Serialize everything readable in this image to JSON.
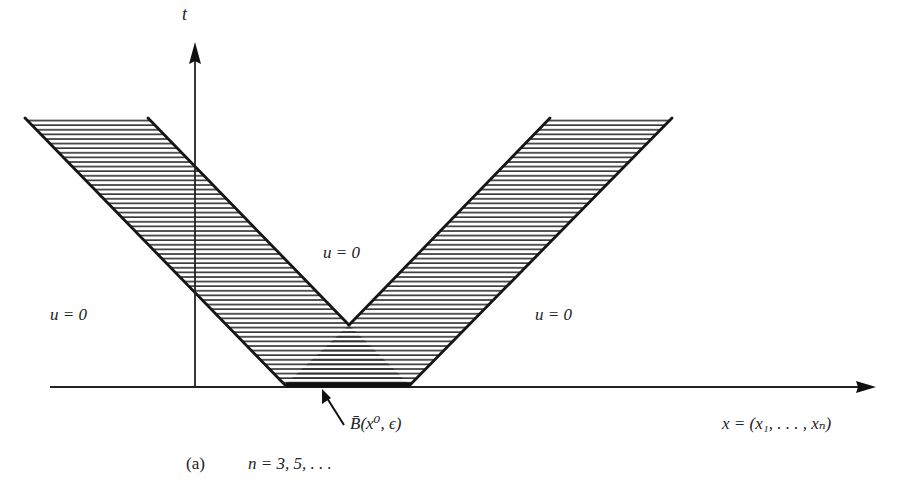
{
  "figure": {
    "axis_t_label": "t",
    "axis_x_label": "x = (x₁, . . . , xₙ)",
    "region_labels": {
      "left": "u = 0",
      "center": "u = 0",
      "right": "u = 0"
    },
    "ball_label": "B̄(x⁰, ϵ)",
    "caption_tag": "(a)",
    "caption_text": "n = 3, 5, . . ."
  },
  "colors": {
    "ink": "#1a1a1a",
    "hatch": "#333333",
    "background": "#ffffff"
  }
}
